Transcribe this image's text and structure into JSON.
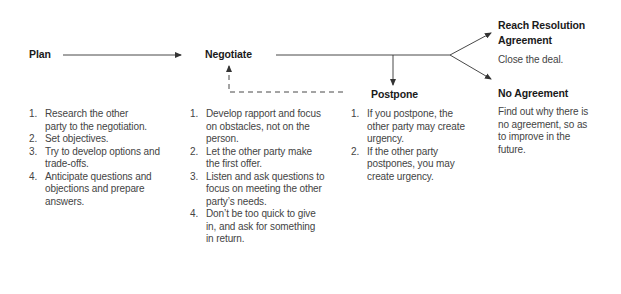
{
  "diagram": {
    "stages": {
      "plan": {
        "title": "Plan"
      },
      "negotiate": {
        "title": "Negotiate"
      },
      "postpone": {
        "title": "Postpone"
      },
      "reach_resolution": {
        "title_line1": "Reach Resolution",
        "title_line2": "Agreement",
        "description": "Close the deal."
      },
      "no_agreement": {
        "title": "No Agreement",
        "description_lines": [
          "Find out why there is",
          "no agreement, so as",
          "to improve in the",
          "future."
        ]
      }
    },
    "plan_steps": [
      {
        "num": "1.",
        "lines": [
          "Research the other",
          "party to the negotiation."
        ]
      },
      {
        "num": "2.",
        "lines": [
          "Set objectives."
        ]
      },
      {
        "num": "3.",
        "lines": [
          "Try to develop options and",
          "trade-offs."
        ]
      },
      {
        "num": "4.",
        "lines": [
          "Anticipate questions and",
          "objections and prepare",
          "answers."
        ]
      }
    ],
    "negotiate_steps": [
      {
        "num": "1.",
        "lines": [
          "Develop rapport and focus",
          "on obstacles, not on the",
          "person."
        ]
      },
      {
        "num": "2.",
        "lines": [
          "Let the other party make",
          "the first offer."
        ]
      },
      {
        "num": "3.",
        "lines": [
          "Listen and ask questions to",
          "focus on meeting the other",
          "party’s needs."
        ]
      },
      {
        "num": "4.",
        "lines": [
          "Don’t be too quick to give",
          "in, and ask for something",
          "in return."
        ]
      }
    ],
    "postpone_steps": [
      {
        "num": "1.",
        "lines": [
          "If you postpone, the",
          "other party may create",
          "urgency."
        ]
      },
      {
        "num": "2.",
        "lines": [
          "If the other party",
          "postpones, you may",
          "create urgency."
        ]
      }
    ],
    "colors": {
      "line": "#333333",
      "text": "#444444",
      "title": "#1a1a1a"
    }
  }
}
